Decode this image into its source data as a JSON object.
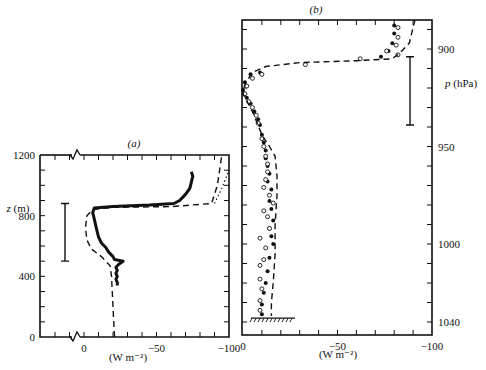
{
  "chart_data": [
    {
      "type": "line",
      "panel_label": "(a)",
      "xlabel": "(W m⁻²)",
      "ylabel": "z (m)",
      "xlim": [
        30,
        -100
      ],
      "ylim": [
        0,
        1200
      ],
      "x_ticks": [
        0,
        -50,
        -100
      ],
      "x_tick_labels": [
        "0",
        "−50",
        "−100"
      ],
      "y_ticks": [
        0,
        400,
        800,
        1200
      ],
      "y_tick_labels": [
        "0",
        "400",
        "800",
        "1200"
      ],
      "axis_break": true,
      "error_bar": {
        "x": -10,
        "z_low": 500,
        "z_high": 880
      },
      "series": [
        {
          "name": "observed",
          "style": "solid-thick",
          "points": [
            [
              23,
              340
            ],
            [
              23,
              360
            ],
            [
              22,
              380
            ],
            [
              23,
              400
            ],
            [
              22,
              420
            ],
            [
              23,
              440
            ],
            [
              22,
              460
            ],
            [
              24,
              480
            ],
            [
              27,
              500
            ],
            [
              21,
              510
            ],
            [
              20,
              530
            ],
            [
              17,
              560
            ],
            [
              15,
              590
            ],
            [
              12,
              620
            ],
            [
              10,
              660
            ],
            [
              9,
              700
            ],
            [
              8,
              740
            ],
            [
              7,
              780
            ],
            [
              6,
              820
            ],
            [
              7,
              850
            ],
            [
              20,
              860
            ],
            [
              45,
              870
            ],
            [
              62,
              880
            ],
            [
              66,
              900
            ],
            [
              70,
              940
            ],
            [
              73,
              980
            ],
            [
              74,
              1020
            ],
            [
              75,
              1060
            ],
            [
              74,
              1090
            ]
          ]
        },
        {
          "name": "model-dashed",
          "style": "dashed",
          "points": [
            [
              21,
              0
            ],
            [
              20,
              200
            ],
            [
              19,
              400
            ],
            [
              18,
              470
            ],
            [
              12,
              530
            ],
            [
              5,
              580
            ],
            [
              2,
              640
            ],
            [
              1,
              720
            ],
            [
              2,
              800
            ],
            [
              6,
              840
            ],
            [
              20,
              855
            ],
            [
              60,
              860
            ],
            [
              88,
              880
            ],
            [
              92,
              1000
            ],
            [
              95,
              1200
            ]
          ]
        },
        {
          "name": "model-dotted",
          "style": "dotted",
          "points": [
            [
              90,
              880
            ],
            [
              95,
              980
            ],
            [
              100,
              1100
            ]
          ]
        }
      ]
    },
    {
      "type": "scatter",
      "panel_label": "(b)",
      "xlabel": "(W m⁻²)",
      "ylabel": "p (hPa)",
      "xlim": [
        0,
        -100
      ],
      "ylim": [
        1047,
        885
      ],
      "x_ticks": [
        0,
        -50,
        -100
      ],
      "x_tick_labels": [
        "0",
        "−50",
        "−100"
      ],
      "y_ticks": [
        900,
        950,
        1000,
        1040
      ],
      "y_tick_labels": [
        "900",
        "950",
        "1000",
        "1040"
      ],
      "error_bar": {
        "x": -87,
        "p_low": 939,
        "p_high": 904
      },
      "ground_level_hPa": 1037,
      "series": [
        {
          "name": "filled-circles",
          "marker": "filled",
          "points": [
            [
              80,
              888
            ],
            [
              80,
              892
            ],
            [
              79,
              897
            ],
            [
              77,
              901
            ],
            [
              73,
              904
            ],
            [
              9,
              912
            ],
            [
              4,
              913
            ],
            [
              1,
              917
            ],
            [
              0,
              921
            ],
            [
              2,
              925
            ],
            [
              4,
              928
            ],
            [
              6,
              932
            ],
            [
              8,
              936
            ],
            [
              9,
              939
            ],
            [
              10,
              944
            ],
            [
              11,
              948
            ],
            [
              12,
              952
            ],
            [
              12,
              956
            ],
            [
              13,
              960
            ],
            [
              14,
              964
            ],
            [
              13,
              968
            ],
            [
              15,
              972
            ],
            [
              14,
              978
            ],
            [
              15,
              982
            ],
            [
              16,
              988
            ],
            [
              14,
              992
            ],
            [
              15,
              996
            ],
            [
              16,
              1000
            ],
            [
              14,
              1007
            ],
            [
              13,
              1014
            ],
            [
              12,
              1020
            ],
            [
              11,
              1025
            ],
            [
              10,
              1031
            ],
            [
              10,
              1036
            ]
          ]
        },
        {
          "name": "open-circles",
          "marker": "open",
          "points": [
            [
              82,
              889
            ],
            [
              82,
              894
            ],
            [
              81,
              898
            ],
            [
              82,
              903
            ],
            [
              76,
              901
            ],
            [
              62,
              905
            ],
            [
              33,
              908
            ],
            [
              10,
              913
            ],
            [
              5,
              915
            ],
            [
              2,
              919
            ],
            [
              1,
              923
            ],
            [
              3,
              927
            ],
            [
              5,
              930
            ],
            [
              7,
              934
            ],
            [
              8,
              938
            ],
            [
              10,
              946
            ],
            [
              11,
              950
            ],
            [
              12,
              955
            ],
            [
              13,
              959
            ],
            [
              13,
              963
            ],
            [
              12,
              967
            ],
            [
              11,
              971
            ],
            [
              14,
              975
            ],
            [
              16,
              979
            ],
            [
              11,
              983
            ],
            [
              13,
              986
            ],
            [
              14,
              992
            ],
            [
              9,
              997
            ],
            [
              12,
              1002
            ],
            [
              11,
              1008
            ],
            [
              9,
              1011
            ],
            [
              9,
              1018
            ],
            [
              10,
              1023
            ],
            [
              9,
              1029
            ],
            [
              9,
              1034
            ]
          ]
        },
        {
          "name": "model-dashed",
          "style": "dashed",
          "points": [
            [
              91,
              885
            ],
            [
              88,
              897
            ],
            [
              83,
              902
            ],
            [
              79,
              905
            ],
            [
              60,
              906
            ],
            [
              30,
              907
            ],
            [
              12,
              909
            ],
            [
              5,
              912
            ],
            [
              1,
              918
            ],
            [
              0,
              923
            ],
            [
              5,
              932
            ],
            [
              10,
              944
            ],
            [
              14,
              950
            ],
            [
              17,
              955
            ],
            [
              18,
              965
            ],
            [
              18,
              975
            ],
            [
              17,
              990
            ],
            [
              17,
              1005
            ],
            [
              16,
              1020
            ],
            [
              15,
              1030
            ],
            [
              15,
              1037
            ]
          ]
        }
      ]
    }
  ]
}
